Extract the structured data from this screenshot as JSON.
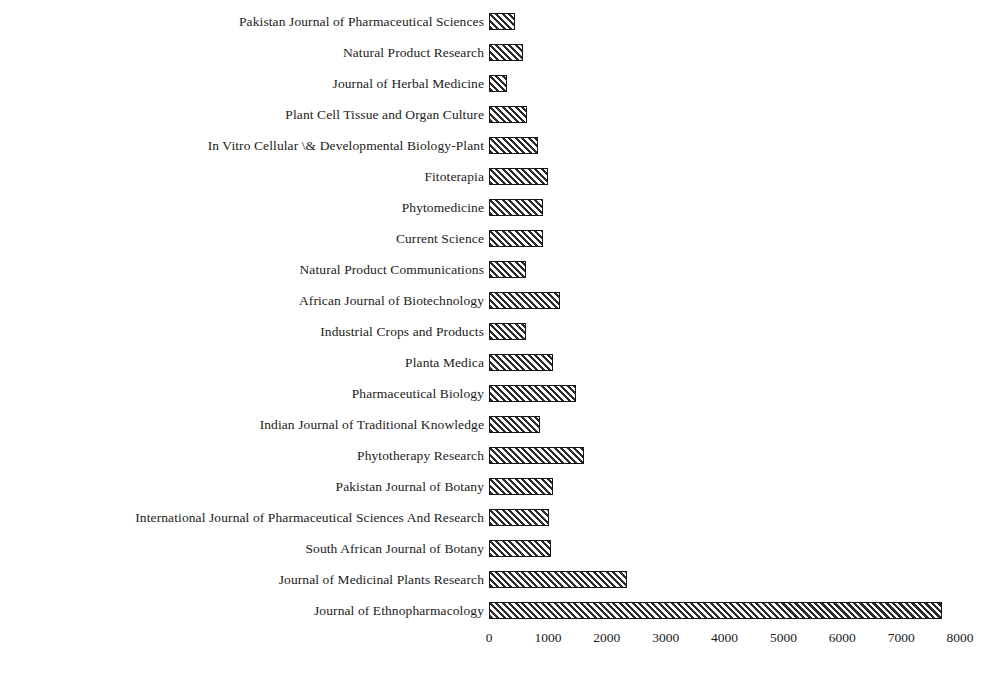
{
  "chart_data": {
    "type": "bar",
    "orientation": "horizontal",
    "title": "",
    "xlabel": "",
    "ylabel": "",
    "xlim": [
      0,
      8000
    ],
    "xticks": [
      "0",
      "1000",
      "2000",
      "3000",
      "4000",
      "5000",
      "6000",
      "7000",
      "8000"
    ],
    "xtick_values": [
      0,
      1000,
      2000,
      3000,
      4000,
      5000,
      6000,
      7000,
      8000
    ],
    "grid": false,
    "legend": false,
    "bar_style": {
      "fill": "diagonal-hatch",
      "hatch_color": "#2b2b2b",
      "background_color": "#ffffff",
      "edge_color": "#141414"
    },
    "categories": [
      "Pakistan Journal of Pharmaceutical Sciences",
      "Natural Product Research",
      "Journal of Herbal Medicine",
      "Plant Cell Tissue and Organ Culture",
      "In Vitro Cellular \\& Developmental Biology-Plant",
      "Fitoterapia",
      "Phytomedicine",
      "Current Science",
      "Natural Product Communications",
      "African Journal of Biotechnology",
      "Industrial Crops and Products",
      "Planta Medica",
      "Pharmaceutical Biology",
      "Indian Journal of Traditional Knowledge",
      "Phytotherapy Research",
      "Pakistan Journal of Botany",
      "International Journal of Pharmaceutical Sciences And Research",
      "South African Journal of Botany",
      "Journal of Medicinal Plants Research",
      "Journal of Ethnopharmacology"
    ],
    "values": [
      450,
      570,
      300,
      640,
      830,
      1010,
      920,
      920,
      620,
      1210,
      620,
      1090,
      1480,
      870,
      1610,
      1080,
      1020,
      1050,
      2340,
      7700
    ]
  }
}
